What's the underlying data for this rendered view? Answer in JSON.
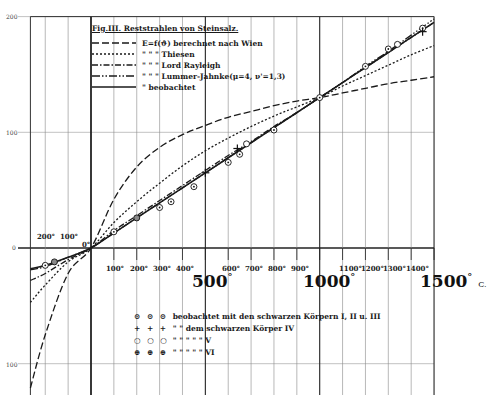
{
  "chart_data": {
    "type": "line",
    "title": "Fig.III. Reststrahlen von Steinsalz.",
    "xlabel": "°C",
    "ylabel": "E",
    "xlim": [
      -265,
      1500
    ],
    "ylim": [
      -125,
      200
    ],
    "grid": true,
    "x_ticks_minor": [
      "200°",
      "100°",
      "0°",
      "100°",
      "200°",
      "300°",
      "400°",
      "600°",
      "700°",
      "800°",
      "900°",
      "1100°",
      "1200°",
      "1300°",
      "1400°"
    ],
    "x_ticks_major": [
      "500°",
      "1000°",
      "1500°"
    ],
    "x_unit": "C.",
    "y_ticks": [
      "200",
      "100",
      "0",
      "100"
    ],
    "legend_position": "upper-left",
    "x": [
      -265,
      -200,
      -100,
      0,
      100,
      200,
      300,
      400,
      500,
      600,
      700,
      800,
      900,
      1000,
      1100,
      1200,
      1300,
      1400,
      1500
    ],
    "series": [
      {
        "name": "E=f(ϑ) berechnet nach Wien",
        "style": "dashed",
        "values": [
          -121,
          -75,
          -22,
          0,
          42,
          70,
          87,
          98,
          106,
          113,
          118,
          123,
          127,
          130,
          134,
          138,
          142,
          145,
          148
        ]
      },
      {
        "name": "\" \" \" Thiesen",
        "style": "dotted",
        "values": [
          -47,
          -32,
          -12,
          0,
          22,
          40,
          56,
          71,
          84,
          95,
          105,
          114,
          122,
          130,
          140,
          149,
          158,
          167,
          175
        ]
      },
      {
        "name": "\" \" \" Lord Rayleigh",
        "style": "dash-dot",
        "values": [
          -28,
          -22,
          -10,
          0,
          15,
          28,
          41,
          54,
          67,
          80,
          92,
          105,
          117,
          130,
          143,
          156,
          169,
          182,
          195
        ]
      },
      {
        "name": "\" \" \" Lummer-Jahnke (μ=4, ν'=1,3)",
        "style": "dash-double-dot",
        "values": [
          -19,
          -16,
          -8,
          0,
          13,
          26,
          39,
          52,
          65,
          78,
          91,
          104,
          117,
          130,
          143,
          157,
          170,
          184,
          198
        ]
      },
      {
        "name": "\" beobachtet",
        "style": "solid",
        "values": [
          -18,
          -15,
          -8,
          0,
          13,
          26,
          39,
          52,
          65,
          78,
          91,
          104,
          117,
          130,
          143,
          156,
          169,
          182,
          195
        ]
      }
    ],
    "observations": [
      {
        "symbol": "⊙",
        "label": "beobachtet mit den schwarzen Körpern I, II u. III",
        "points": [
          [
            -200,
            -15
          ],
          [
            100,
            14
          ],
          [
            300,
            35
          ],
          [
            350,
            40
          ],
          [
            450,
            53
          ],
          [
            600,
            74
          ],
          [
            650,
            81
          ],
          [
            800,
            102
          ],
          [
            1000,
            130
          ],
          [
            1200,
            157
          ],
          [
            1300,
            172
          ],
          [
            1450,
            190
          ]
        ]
      },
      {
        "symbol": "+",
        "label": "\" \" dem schwarzen Körper IV",
        "points": [
          [
            500,
            65
          ],
          [
            640,
            86
          ],
          [
            1450,
            187
          ]
        ]
      },
      {
        "symbol": "○",
        "label": "\" \" \" \" \" V",
        "points": [
          [
            680,
            90
          ],
          [
            1340,
            176
          ]
        ]
      },
      {
        "symbol": "⊕",
        "label": "\" \" \" \" \" VI",
        "points": [
          [
            -160,
            -12
          ],
          [
            200,
            26
          ]
        ]
      }
    ]
  },
  "legend": {
    "title": "Fig.III. Reststrahlen von Steinsalz.",
    "rows": [
      {
        "text": "E=f(ϑ) berechnet nach Wien"
      },
      {
        "text": "\"          \"          \"   Thiesen"
      },
      {
        "text": "\"          \"          \"   Lord Rayleigh"
      },
      {
        "text": "\"          \"          \"   Lummer-Jahnke(μ=4, ν'=1,3)"
      },
      {
        "text": "\"   beobachtet"
      }
    ]
  },
  "obs_legend": [
    {
      "symbols": "⊙ ⊙ ⊙",
      "text": "beobachtet  mit den schwarzen Körpern  I, II u. III"
    },
    {
      "symbols": "+ + +",
      "text": "\"          \"  dem schwarzen Körper  IV"
    },
    {
      "symbols": "○ ○ ○",
      "text": "\"          \"    \"      \"          \"     V"
    },
    {
      "symbols": "⊕ ⊕ ⊕",
      "text": "\"          \"    \"      \"          \"     VI"
    }
  ],
  "axis": {
    "y_labels": {
      "top": "200",
      "mid": "100",
      "zero": "0",
      "neg": "100"
    },
    "x_small": {
      "neg200": "200°",
      "neg100": "100°",
      "zero": "0°",
      "p100": "100°",
      "p200": "200°",
      "p300": "300°",
      "p400": "400°",
      "p600": "600°",
      "p700": "700°",
      "p800": "800°",
      "p900": "900°",
      "p1100": "1100°",
      "p1200": "1200°",
      "p1300": "1300°",
      "p1400": "1400°"
    },
    "x_big": {
      "p500": "500",
      "p1000": "1000",
      "p1500": "1500"
    },
    "degree": "°",
    "unit": "C."
  }
}
